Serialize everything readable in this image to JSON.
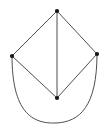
{
  "figure": {
    "canvas": {
      "width": 109,
      "height": 135,
      "background": "#ffffff"
    },
    "stroke_color": "#3a3a3a",
    "vertex_color": "#151515",
    "stroke_width": 0.9,
    "vertex_radius": 2.1
  },
  "chart_data": {
    "type": "diagram",
    "title": "",
    "vertices": [
      {
        "id": "top",
        "label": "",
        "x": 57,
        "y": 11
      },
      {
        "id": "left",
        "label": "",
        "x": 12,
        "y": 56
      },
      {
        "id": "right",
        "label": "",
        "x": 97,
        "y": 54
      },
      {
        "id": "bottom",
        "label": "",
        "x": 57,
        "y": 98
      }
    ],
    "edges": [
      {
        "id": "e-top-left",
        "from": "top",
        "to": "left",
        "shape": "straight"
      },
      {
        "id": "e-top-right",
        "from": "top",
        "to": "right",
        "shape": "straight"
      },
      {
        "id": "e-top-bottom",
        "from": "top",
        "to": "bottom",
        "shape": "straight"
      },
      {
        "id": "e-left-bottom",
        "from": "left",
        "to": "bottom",
        "shape": "straight"
      },
      {
        "id": "e-right-bottom",
        "from": "right",
        "to": "bottom",
        "shape": "straight"
      },
      {
        "id": "e-left-right-arc",
        "from": "left",
        "to": "right",
        "shape": "curved",
        "path": "M 12 56 C 12 112, 32 124, 56 123 C 80 122, 97 106, 97 54"
      }
    ],
    "vertex_count": 4,
    "edge_count": 6
  }
}
